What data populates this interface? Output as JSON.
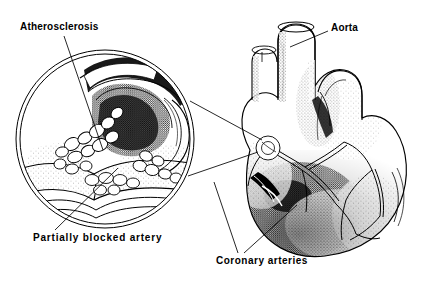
{
  "figure": {
    "style": "pen-and-ink stipple line drawing",
    "background_color": "#ffffff",
    "ink_color": "#000000",
    "width": 425,
    "height": 282
  },
  "labels": {
    "atherosclerosis": "Atherosclerosis",
    "partially_blocked_artery": "Partially  blocked  artery",
    "aorta": "Aorta",
    "coronary_arteries": "Coronary  arteries"
  },
  "parts": {
    "inset": {
      "name": "magnified-artery-cross-section",
      "shape": "double-ring circle",
      "center_x": 105,
      "center_y": 139,
      "radius": 89,
      "contents": "cut-away coronary artery branch with fatty plaque deposits narrowing the lumen"
    },
    "heart": {
      "name": "heart-illustration",
      "contents": "anterior view of heart with aorta, pulmonary trunk and branching coronary arteries"
    }
  },
  "leaders": {
    "atherosclerosis": "from label down-right into plaque deposits inside the circle",
    "partially_blocked_artery": "from label up-right into the narrowed artery lumen",
    "aorta": "from label left into the aorta vessel",
    "coronary_arteries": "two lines from label up into the coronary vessels on the heart",
    "magnifier": "two lines from the circle to the coronary artery region on the heart"
  }
}
